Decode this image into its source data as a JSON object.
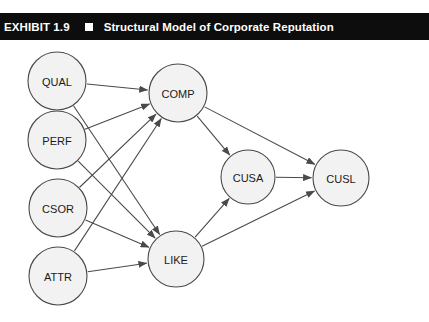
{
  "header": {
    "exhibit_label": "EXHIBIT 1.9",
    "bullet_icon": "filled-square-icon",
    "title": "Structural Model of Corporate Reputation",
    "background_color": "#0d0d0d",
    "text_color": "#ffffff"
  },
  "diagram": {
    "type": "path-diagram",
    "node_fill": "#f2f2f2",
    "node_stroke": "#4a4a4a",
    "nodes": [
      {
        "id": "QUAL",
        "label": "QUAL",
        "cx": 57,
        "cy": 41,
        "r": 29
      },
      {
        "id": "PERF",
        "label": "PERF",
        "cx": 57,
        "cy": 100,
        "r": 29
      },
      {
        "id": "CSOR",
        "label": "CSOR",
        "cx": 58,
        "cy": 168,
        "r": 29
      },
      {
        "id": "ATTR",
        "label": "ATTR",
        "cx": 58,
        "cy": 236,
        "r": 29
      },
      {
        "id": "COMP",
        "label": "COMP",
        "cx": 178,
        "cy": 53,
        "r": 29
      },
      {
        "id": "LIKE",
        "label": "LIKE",
        "cx": 176,
        "cy": 219,
        "r": 28
      },
      {
        "id": "CUSA",
        "label": "CUSA",
        "cx": 248,
        "cy": 137,
        "r": 27
      },
      {
        "id": "CUSL",
        "label": "CUSL",
        "cx": 341,
        "cy": 138,
        "r": 28
      }
    ],
    "edges": [
      {
        "from": "QUAL",
        "to": "COMP"
      },
      {
        "from": "QUAL",
        "to": "LIKE"
      },
      {
        "from": "PERF",
        "to": "COMP"
      },
      {
        "from": "PERF",
        "to": "LIKE"
      },
      {
        "from": "CSOR",
        "to": "COMP"
      },
      {
        "from": "CSOR",
        "to": "LIKE"
      },
      {
        "from": "ATTR",
        "to": "COMP"
      },
      {
        "from": "ATTR",
        "to": "LIKE"
      },
      {
        "from": "COMP",
        "to": "CUSA"
      },
      {
        "from": "COMP",
        "to": "CUSL"
      },
      {
        "from": "LIKE",
        "to": "CUSA"
      },
      {
        "from": "LIKE",
        "to": "CUSL"
      },
      {
        "from": "CUSA",
        "to": "CUSL"
      }
    ]
  }
}
